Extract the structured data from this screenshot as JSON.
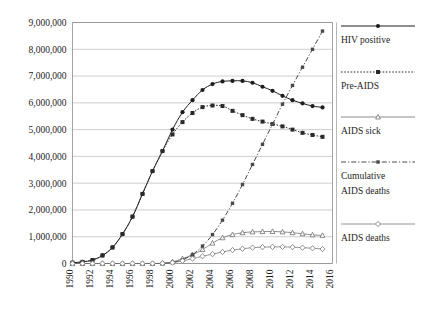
{
  "chart_data": {
    "type": "line",
    "title": "",
    "xlabel": "",
    "ylabel": "",
    "x": [
      1990,
      1991,
      1992,
      1993,
      1994,
      1995,
      1996,
      1997,
      1998,
      1999,
      2000,
      2001,
      2002,
      2003,
      2004,
      2005,
      2006,
      2007,
      2008,
      2009,
      2010,
      2011,
      2012,
      2013,
      2014,
      2015
    ],
    "xlim": [
      1990,
      2016
    ],
    "ylim": [
      0,
      9000000
    ],
    "ytick_labels": [
      "0",
      "1,000,000",
      "2,000,000",
      "3,000,000",
      "4,000,000",
      "5,000,000",
      "6,000,000",
      "7,000,000",
      "8,000,000",
      "9,000,000"
    ],
    "ytick_values": [
      0,
      1000000,
      2000000,
      3000000,
      4000000,
      5000000,
      6000000,
      7000000,
      8000000,
      9000000
    ],
    "xtick_labels": [
      "1990",
      "1992",
      "1994",
      "1996",
      "1998",
      "2000",
      "2002",
      "2004",
      "2006",
      "2008",
      "2010",
      "2012",
      "2014",
      "2016"
    ],
    "xtick_values": [
      1990,
      1992,
      1994,
      1996,
      1998,
      2000,
      2002,
      2004,
      2006,
      2008,
      2010,
      2012,
      2014,
      2016
    ],
    "grid": true,
    "legend_position": "right",
    "series": [
      {
        "name": "HIV positive",
        "marker": "filled-circle",
        "line_style": "solid",
        "color": "#1d1d1d",
        "values": [
          30000,
          60000,
          130000,
          300000,
          600000,
          1100000,
          1750000,
          2600000,
          3450000,
          4200000,
          5000000,
          5650000,
          6100000,
          6480000,
          6700000,
          6800000,
          6820000,
          6820000,
          6750000,
          6600000,
          6450000,
          6260000,
          6100000,
          5980000,
          5880000,
          5830000
        ]
      },
      {
        "name": "Pre-AIDS",
        "marker": "filled-square",
        "line_style": "dotted",
        "color": "#2a2a2a",
        "values": [
          30000,
          60000,
          130000,
          300000,
          600000,
          1100000,
          1750000,
          2600000,
          3450000,
          4200000,
          4820000,
          5280000,
          5620000,
          5840000,
          5900000,
          5880000,
          5700000,
          5540000,
          5400000,
          5300000,
          5210000,
          5120000,
          5000000,
          4880000,
          4800000,
          4730000
        ]
      },
      {
        "name": "AIDS sick",
        "marker": "open-triangle",
        "line_style": "solid-light",
        "color": "#6e6e6e",
        "values": [
          0,
          0,
          0,
          0,
          0,
          0,
          0,
          0,
          0,
          10000,
          60000,
          180000,
          330000,
          520000,
          760000,
          960000,
          1080000,
          1150000,
          1180000,
          1190000,
          1195000,
          1180000,
          1150000,
          1110000,
          1070000,
          1050000
        ]
      },
      {
        "name": "Cumulative AIDS deaths",
        "marker": "filled-square-small",
        "line_style": "dash-dot",
        "color": "#4a4a4a",
        "values": [
          0,
          0,
          0,
          0,
          0,
          0,
          0,
          0,
          0,
          5000,
          40000,
          140000,
          330000,
          650000,
          1080000,
          1620000,
          2250000,
          2950000,
          3700000,
          4450000,
          5200000,
          5950000,
          6650000,
          7330000,
          8000000,
          8680000
        ]
      },
      {
        "name": "AIDS deaths",
        "marker": "open-diamond",
        "line_style": "solid-light",
        "color": "#777777",
        "values": [
          0,
          0,
          0,
          0,
          0,
          0,
          0,
          0,
          0,
          5000,
          30000,
          100000,
          180000,
          270000,
          350000,
          430000,
          500000,
          550000,
          590000,
          610000,
          620000,
          620000,
          610000,
          590000,
          570000,
          540000
        ]
      }
    ]
  },
  "legend": {
    "entries": [
      {
        "label": "HIV positive"
      },
      {
        "label": "Pre-AIDS"
      },
      {
        "label": "AIDS sick"
      },
      {
        "label": "Cumulative"
      },
      {
        "label": "AIDS deaths"
      },
      {
        "label": "AIDS deaths"
      }
    ]
  }
}
